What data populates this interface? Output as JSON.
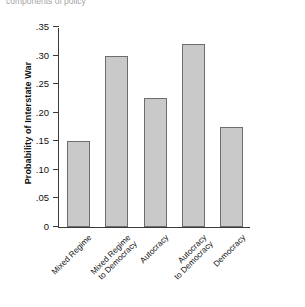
{
  "figure": {
    "top_fragment": "components of policy",
    "background_color": "#ffffff"
  },
  "chart_data": {
    "type": "bar",
    "title": "",
    "subtitle": "",
    "xlabel": "",
    "ylabel": "Probability of Interstate War",
    "categories": [
      "Mixed Regime",
      "Mixed Regime to Democracy",
      "Autocracy",
      "Autocracy to Democracy",
      "Democracy"
    ],
    "category_lines": [
      [
        "Mixed Regime"
      ],
      [
        "Mixed Regime",
        "to Democracy"
      ],
      [
        "Autocracy"
      ],
      [
        "Autocracy",
        "to Democracy"
      ],
      [
        "Democracy"
      ]
    ],
    "values": [
      0.15,
      0.3,
      0.225,
      0.32,
      0.175
    ],
    "ylim": [
      0,
      0.35
    ],
    "yticks": [
      0,
      0.05,
      0.1,
      0.15,
      0.2,
      0.25,
      0.3,
      0.35
    ],
    "ytick_labels": [
      "0",
      ".05",
      ".10",
      ".15",
      ".20",
      ".25",
      ".30",
      ".35"
    ],
    "grid": false,
    "legend": false,
    "legend_position": "none",
    "bar_fill_color": "#c9c9c9",
    "bar_edge_color": "#6d6d6d",
    "axis_color": "#3a3a3a"
  }
}
